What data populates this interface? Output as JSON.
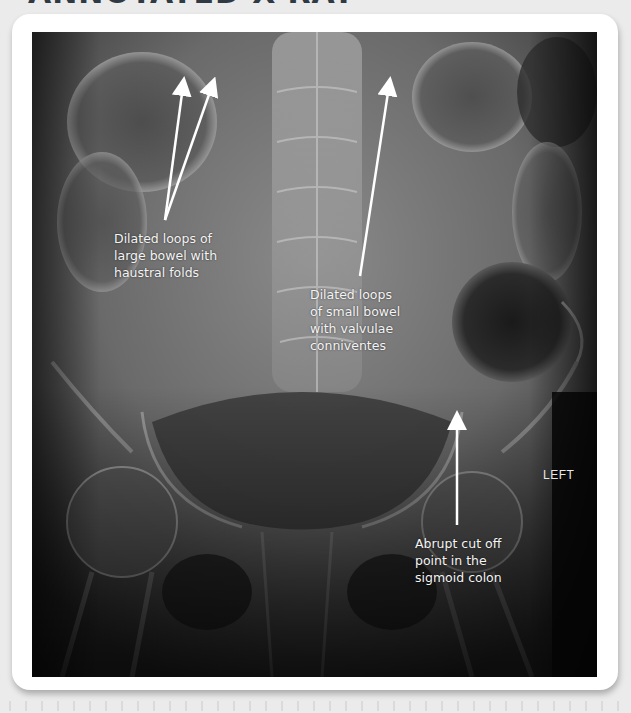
{
  "page": {
    "title": "ANNOTATED X-RAY"
  },
  "figure": {
    "image_description": "Abdominal X-ray (AP) showing dilated bowel loops",
    "orientation_marker": "LEFT",
    "annotations": [
      {
        "id": "large-bowel",
        "text": "Dilated loops of\nlarge bowel with\nhaustral folds",
        "arrow_count": 2
      },
      {
        "id": "small-bowel",
        "text": "Dilated loops\nof small bowel\nwith valvulae\nconniventes",
        "arrow_count": 1
      },
      {
        "id": "sigmoid-cutoff",
        "text": "Abrupt cut off\npoint in the\nsigmoid colon",
        "arrow_count": 1
      }
    ]
  },
  "colors": {
    "page_background": "#ebebeb",
    "card_background": "#ffffff",
    "title_color": "#2f3a44",
    "annotation_color": "#ffffff"
  }
}
